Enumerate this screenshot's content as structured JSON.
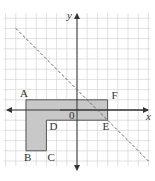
{
  "figure": {
    "type": "coordinate-plane",
    "grid": {
      "xmin": -7,
      "xmax": 7,
      "ymin": -5.5,
      "ymax": 9.5,
      "step": 1
    },
    "origin_px": [
      77,
      110
    ],
    "unit_px": 10.2,
    "axes": {
      "x_label": "x",
      "y_label": "y",
      "origin_label": "0"
    },
    "shape": {
      "name": "L-shaped polygon ABCDEF",
      "fill": "#c8c8c8",
      "stroke": "#555555",
      "vertices": [
        {
          "label": "A",
          "x": -5,
          "y": 1
        },
        {
          "label": "F",
          "x": 3,
          "y": 1
        },
        {
          "label": "E",
          "x": 3,
          "y": -1
        },
        {
          "label": "D",
          "x": -3,
          "y": -1
        },
        {
          "label": "C",
          "x": -3,
          "y": -4
        },
        {
          "label": "B",
          "x": -5,
          "y": -4
        }
      ]
    },
    "dashed_line": {
      "equation": "y = -x + 2",
      "from": [
        -6,
        8
      ],
      "to": [
        7,
        -5
      ],
      "color": "#666666"
    },
    "colors": {
      "grid": "#d4d4d4",
      "axes": "#333333",
      "text": "#333333"
    }
  }
}
